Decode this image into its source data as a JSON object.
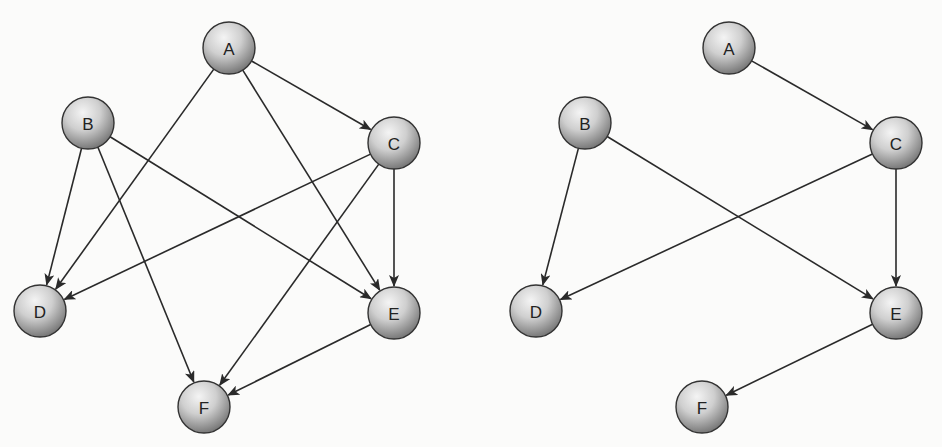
{
  "node_radius": 26,
  "graphs": [
    {
      "name": "full-graph",
      "nodes": [
        {
          "id": "A",
          "label": "A",
          "x": 229,
          "y": 48
        },
        {
          "id": "B",
          "label": "B",
          "x": 88,
          "y": 123
        },
        {
          "id": "C",
          "label": "C",
          "x": 394,
          "y": 143
        },
        {
          "id": "D",
          "label": "D",
          "x": 40,
          "y": 311
        },
        {
          "id": "E",
          "label": "E",
          "x": 394,
          "y": 313
        },
        {
          "id": "F",
          "label": "F",
          "x": 204,
          "y": 407
        }
      ],
      "edges": [
        [
          "A",
          "C"
        ],
        [
          "A",
          "D"
        ],
        [
          "A",
          "E"
        ],
        [
          "B",
          "D"
        ],
        [
          "B",
          "E"
        ],
        [
          "B",
          "F"
        ],
        [
          "C",
          "D"
        ],
        [
          "C",
          "E"
        ],
        [
          "C",
          "F"
        ],
        [
          "E",
          "F"
        ]
      ]
    },
    {
      "name": "reduced-graph",
      "nodes": [
        {
          "id": "A",
          "label": "A",
          "x": 729,
          "y": 48
        },
        {
          "id": "B",
          "label": "B",
          "x": 585,
          "y": 123
        },
        {
          "id": "C",
          "label": "C",
          "x": 896,
          "y": 143
        },
        {
          "id": "D",
          "label": "D",
          "x": 536,
          "y": 311
        },
        {
          "id": "E",
          "label": "E",
          "x": 896,
          "y": 313
        },
        {
          "id": "F",
          "label": "F",
          "x": 702,
          "y": 407
        }
      ],
      "edges": [
        [
          "A",
          "C"
        ],
        [
          "B",
          "D"
        ],
        [
          "B",
          "E"
        ],
        [
          "C",
          "D"
        ],
        [
          "C",
          "E"
        ],
        [
          "E",
          "F"
        ]
      ]
    }
  ]
}
